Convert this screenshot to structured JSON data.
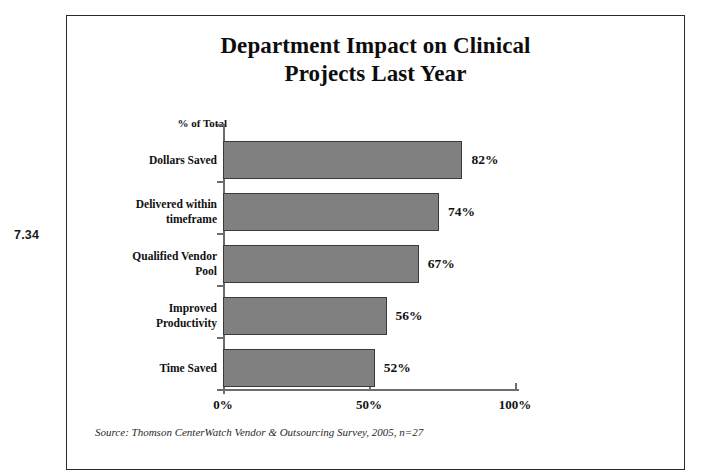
{
  "figure": {
    "number": "7.34"
  },
  "chart_data": {
    "type": "bar",
    "orientation": "horizontal",
    "title": "Department Impact on Clinical Projects Last Year",
    "title_lines": [
      "Department Impact on Clinical",
      "Projects Last Year"
    ],
    "xlabel": "",
    "ylabel": "",
    "axis_title": "% of Total",
    "categories": [
      "Dollars Saved",
      "Delivered within timeframe",
      "Qualified Vendor Pool",
      "Improved Productivity",
      "Time Saved"
    ],
    "category_lines": [
      [
        "Dollars Saved"
      ],
      [
        "Delivered within",
        "timeframe"
      ],
      [
        "Qualified Vendor",
        "Pool"
      ],
      [
        "Improved",
        "Productivity"
      ],
      [
        "Time Saved"
      ]
    ],
    "values": [
      82,
      74,
      67,
      56,
      52
    ],
    "value_labels": [
      "82%",
      "74%",
      "67%",
      "56%",
      "52%"
    ],
    "xlim": [
      0,
      100
    ],
    "xticks": [
      0,
      50,
      100
    ],
    "xtick_labels": [
      "0%",
      "50%",
      "100%"
    ],
    "grid": false,
    "legend": null,
    "bar_color": "#808080",
    "bar_border_color": "#3a3a3a",
    "axis_color": "#6d6d6d",
    "text_color": "#111111"
  },
  "source": {
    "note": "Source: Thomson CenterWatch Vendor & Outsourcing Survey, 2005, n=27"
  }
}
